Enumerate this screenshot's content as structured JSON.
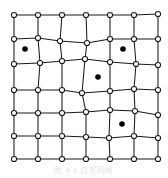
{
  "figure": {
    "caption": "图 4  4  边形网格",
    "colors": {
      "background": "#ffffff",
      "edge": "#1a1a1a",
      "node_fill": "#ffffff",
      "node_stroke": "#1a1a1a",
      "marker": "#000000",
      "caption": "#c9c9c9"
    },
    "geometry": {
      "width": 168,
      "height": 178,
      "mesh_width": 168,
      "mesh_height": 165,
      "rows": 7,
      "columns": 7,
      "node_radius": 2.6,
      "marker_radius": 2.8,
      "edge_width": 1.05
    }
  },
  "chart_data": {
    "type": "scatter",
    "xlabel": "",
    "ylabel": "",
    "xlim": [
      0,
      168
    ],
    "ylim": [
      0,
      165
    ],
    "grid": false,
    "legend": null,
    "series": [
      {
        "name": "mesh-nodes",
        "marker": "open-circle",
        "rows": [
          {
            "row": 0,
            "points": [
              [
                14,
                15
              ],
              [
                38,
                15
              ],
              [
                62,
                15
              ],
              [
                86,
                15
              ],
              [
                110,
                15
              ],
              [
                134,
                15
              ],
              [
                158,
                14
              ]
            ]
          },
          {
            "row": 1,
            "points": [
              [
                14,
                39
              ],
              [
                38,
                38
              ],
              [
                60,
                41
              ],
              [
                87,
                43
              ],
              [
                110,
                39
              ],
              [
                134,
                39
              ],
              [
                158,
                39
              ]
            ]
          },
          {
            "row": 2,
            "points": [
              [
                14,
                64
              ],
              [
                40,
                63
              ],
              [
                62,
                61
              ],
              [
                85,
                59
              ],
              [
                110,
                62
              ],
              [
                136,
                64
              ],
              [
                158,
                65
              ]
            ]
          },
          {
            "row": 3,
            "points": [
              [
                14,
                90
              ],
              [
                38,
                90
              ],
              [
                62,
                90
              ],
              [
                82,
                93
              ],
              [
                110,
                91
              ],
              [
                134,
                89
              ],
              [
                158,
                90
              ]
            ]
          },
          {
            "row": 4,
            "points": [
              [
                14,
                113
              ],
              [
                38,
                113
              ],
              [
                62,
                113
              ],
              [
                86,
                112
              ],
              [
                110,
                110
              ],
              [
                135,
                111
              ],
              [
                158,
                115
              ]
            ]
          },
          {
            "row": 5,
            "points": [
              [
                14,
                136
              ],
              [
                38,
                136
              ],
              [
                62,
                136
              ],
              [
                86,
                137
              ],
              [
                109,
                138
              ],
              [
                134,
                136
              ],
              [
                158,
                138
              ]
            ]
          },
          {
            "row": 6,
            "points": [
              [
                14,
                159
              ],
              [
                38,
                159
              ],
              [
                62,
                159
              ],
              [
                86,
                159
              ],
              [
                110,
                159
              ],
              [
                134,
                159
              ],
              [
                158,
                159
              ]
            ]
          }
        ]
      },
      {
        "name": "marker-points",
        "marker": "filled-circle",
        "points": [
          [
            25,
            49
          ],
          [
            123,
            49
          ],
          [
            98,
            77
          ],
          [
            122,
            124
          ]
        ]
      }
    ]
  }
}
